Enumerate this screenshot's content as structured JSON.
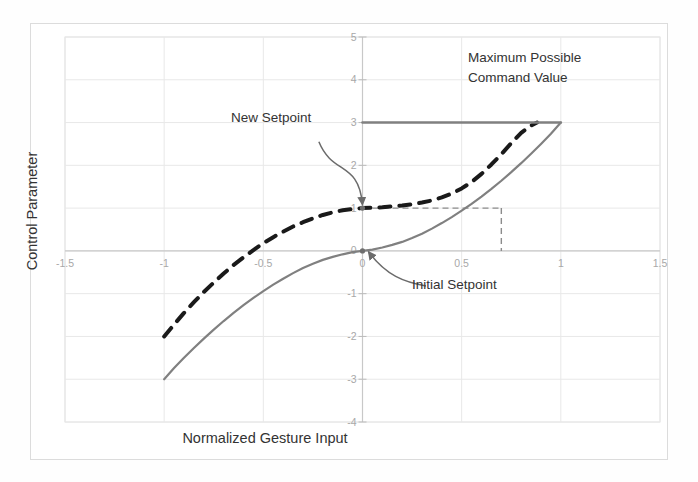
{
  "figure": {
    "background_color": "#ffffff",
    "frame_color": "#dcdcdc"
  },
  "axis_titles": {
    "x": "Normalized Gesture Input",
    "y": "Control Parameter"
  },
  "annotations": {
    "max_command_line1": "Maximum Possible",
    "max_command_line2": "Command Value",
    "new_setpoint": "New Setpoint",
    "initial_setpoint": "Initial Setpoint"
  },
  "chart_data": {
    "type": "line",
    "title": "",
    "xlabel": "Normalized Gesture Input",
    "ylabel": "Control Parameter",
    "xlim": [
      -1.5,
      1.5
    ],
    "ylim": [
      -4,
      5
    ],
    "xticks": [
      -1.5,
      -1,
      -0.5,
      0,
      0.5,
      1,
      1.5
    ],
    "xticklabels": [
      "-1.5",
      "-1",
      "-0.5",
      "0",
      "0.5",
      "1",
      "1.5"
    ],
    "yticks": [
      -4,
      -3,
      -2,
      -1,
      0,
      1,
      2,
      3,
      4,
      5
    ],
    "yticklabels": [
      "-4",
      "-3",
      "-2",
      "-1",
      "0",
      "1",
      "2",
      "3",
      "4",
      "5"
    ],
    "grid": true,
    "legend": "none",
    "series": [
      {
        "name": "Initial Setpoint Response",
        "style": "solid",
        "color": "#808080",
        "width": 2.2,
        "points": [
          [
            -1.0,
            -3.0
          ],
          [
            -0.95,
            -2.74
          ],
          [
            -0.9,
            -2.5
          ],
          [
            -0.85,
            -2.27
          ],
          [
            -0.8,
            -2.05
          ],
          [
            -0.75,
            -1.84
          ],
          [
            -0.7,
            -1.64
          ],
          [
            -0.65,
            -1.45
          ],
          [
            -0.6,
            -1.27
          ],
          [
            -0.55,
            -1.1
          ],
          [
            -0.5,
            -0.94
          ],
          [
            -0.45,
            -0.79
          ],
          [
            -0.4,
            -0.65
          ],
          [
            -0.35,
            -0.52
          ],
          [
            -0.3,
            -0.4
          ],
          [
            -0.25,
            -0.3
          ],
          [
            -0.2,
            -0.21
          ],
          [
            -0.15,
            -0.14
          ],
          [
            -0.1,
            -0.08
          ],
          [
            -0.05,
            -0.03
          ],
          [
            0.0,
            0.0
          ],
          [
            0.05,
            0.03
          ],
          [
            0.1,
            0.08
          ],
          [
            0.15,
            0.14
          ],
          [
            0.2,
            0.21
          ],
          [
            0.25,
            0.3
          ],
          [
            0.3,
            0.4
          ],
          [
            0.35,
            0.52
          ],
          [
            0.4,
            0.65
          ],
          [
            0.45,
            0.79
          ],
          [
            0.5,
            0.94
          ],
          [
            0.55,
            1.1
          ],
          [
            0.6,
            1.27
          ],
          [
            0.65,
            1.45
          ],
          [
            0.7,
            1.64
          ],
          [
            0.75,
            1.84
          ],
          [
            0.8,
            2.05
          ],
          [
            0.85,
            2.27
          ],
          [
            0.9,
            2.5
          ],
          [
            0.95,
            2.74
          ],
          [
            1.0,
            3.0
          ]
        ]
      },
      {
        "name": "New Setpoint Response",
        "style": "dashed",
        "color": "#1a1a1a",
        "width": 4.0,
        "points": [
          [
            -1.0,
            -2.0
          ],
          [
            -0.95,
            -1.72
          ],
          [
            -0.9,
            -1.45
          ],
          [
            -0.85,
            -1.2
          ],
          [
            -0.8,
            -0.96
          ],
          [
            -0.75,
            -0.74
          ],
          [
            -0.7,
            -0.53
          ],
          [
            -0.65,
            -0.33
          ],
          [
            -0.6,
            -0.15
          ],
          [
            -0.55,
            0.02
          ],
          [
            -0.5,
            0.18
          ],
          [
            -0.45,
            0.32
          ],
          [
            -0.4,
            0.45
          ],
          [
            -0.35,
            0.57
          ],
          [
            -0.3,
            0.67
          ],
          [
            -0.25,
            0.76
          ],
          [
            -0.2,
            0.84
          ],
          [
            -0.15,
            0.9
          ],
          [
            -0.1,
            0.95
          ],
          [
            -0.05,
            0.98
          ],
          [
            0.0,
            1.0
          ],
          [
            0.05,
            1.01
          ],
          [
            0.1,
            1.02
          ],
          [
            0.15,
            1.04
          ],
          [
            0.2,
            1.06
          ],
          [
            0.25,
            1.09
          ],
          [
            0.3,
            1.13
          ],
          [
            0.35,
            1.18
          ],
          [
            0.4,
            1.25
          ],
          [
            0.45,
            1.34
          ],
          [
            0.5,
            1.46
          ],
          [
            0.55,
            1.61
          ],
          [
            0.6,
            1.8
          ],
          [
            0.65,
            2.02
          ],
          [
            0.7,
            2.26
          ],
          [
            0.75,
            2.52
          ],
          [
            0.8,
            2.76
          ],
          [
            0.85,
            2.93
          ],
          [
            0.88,
            3.0
          ]
        ]
      },
      {
        "name": "Maximum Possible Command Value",
        "style": "solid",
        "color": "#808080",
        "width": 2.6,
        "points": [
          [
            0.0,
            3.0
          ],
          [
            1.0,
            3.0
          ]
        ]
      }
    ],
    "reference_lines": [
      {
        "name": "new-setpoint-horizontal",
        "style": "dashed",
        "color": "#8c8c8c",
        "points": [
          [
            0.0,
            1.0
          ],
          [
            0.7,
            1.0
          ]
        ]
      },
      {
        "name": "crossover-vertical",
        "style": "dashed",
        "color": "#8c8c8c",
        "points": [
          [
            0.7,
            1.0
          ],
          [
            0.7,
            0.0
          ]
        ]
      }
    ],
    "markers": [
      {
        "name": "initial-setpoint",
        "x": 0.0,
        "y": 0.0
      },
      {
        "name": "new-setpoint",
        "x": 0.0,
        "y": 1.0
      }
    ],
    "annotation_arrows": [
      {
        "name": "new-setpoint-arrow",
        "from": [
          -0.22,
          2.55
        ],
        "to": [
          0.0,
          1.08
        ]
      },
      {
        "name": "initial-setpoint-arrow",
        "from": [
          0.32,
          -0.82
        ],
        "to": [
          0.03,
          -0.02
        ]
      }
    ]
  }
}
